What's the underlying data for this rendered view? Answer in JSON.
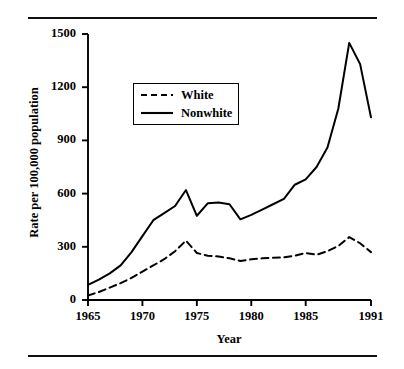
{
  "figure": {
    "rule_top": "",
    "rule_bottom": "",
    "ghost_caption": ""
  },
  "chart_data": {
    "type": "line",
    "title": "",
    "xlabel": "Year",
    "ylabel": "Rate per 100,000 population",
    "xlim": [
      1965,
      1991
    ],
    "ylim": [
      0,
      1500
    ],
    "grid": false,
    "legend_position": "upper-left-inside",
    "xticks": [
      1965,
      1970,
      1975,
      1980,
      1985,
      1991
    ],
    "xtick_labels": [
      "1965",
      "1970",
      "1975",
      "1980",
      "1985",
      "1991"
    ],
    "yticks": [
      0,
      300,
      600,
      900,
      1200,
      1500
    ],
    "ytick_labels": [
      "0",
      "300",
      "600",
      "900",
      "1200",
      "1500"
    ],
    "x": [
      1965,
      1966,
      1967,
      1968,
      1969,
      1970,
      1971,
      1972,
      1973,
      1974,
      1975,
      1976,
      1977,
      1978,
      1979,
      1980,
      1981,
      1982,
      1983,
      1984,
      1985,
      1986,
      1987,
      1988,
      1989,
      1990,
      1991
    ],
    "series": [
      {
        "name": "White",
        "style": "dashed",
        "color": "#000000",
        "values": [
          25,
          45,
          70,
          95,
          125,
          160,
          195,
          230,
          275,
          335,
          265,
          250,
          245,
          235,
          220,
          230,
          235,
          238,
          240,
          250,
          265,
          255,
          275,
          305,
          355,
          320,
          270
        ]
      },
      {
        "name": "Nonwhite",
        "style": "solid",
        "color": "#000000",
        "values": [
          85,
          115,
          150,
          195,
          270,
          360,
          450,
          490,
          530,
          620,
          475,
          545,
          550,
          540,
          455,
          480,
          510,
          540,
          570,
          650,
          680,
          750,
          860,
          1080,
          1450,
          1330,
          1030
        ]
      }
    ]
  },
  "legend": {
    "entries": [
      {
        "label": "White",
        "style": "dashed"
      },
      {
        "label": "Nonwhite",
        "style": "solid"
      }
    ]
  },
  "axes": {
    "y_title": "Rate per 100,000 population",
    "x_title": "Year"
  }
}
